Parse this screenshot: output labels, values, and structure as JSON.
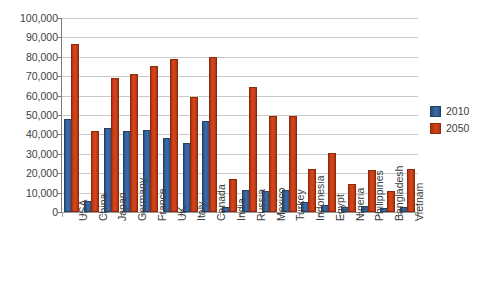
{
  "chart_data": {
    "type": "bar",
    "title": "",
    "subtitle": "",
    "xlabel": "",
    "ylabel": "",
    "ylim": [
      0,
      100000
    ],
    "ytick_step": 10000,
    "ytick_labels": [
      "100,000",
      "90,000",
      "80,000",
      "70,000",
      "60,000",
      "50,000",
      "40,000",
      "30,000",
      "20,000",
      "10,000",
      "0"
    ],
    "grid": "horizontal",
    "legend_position": "right",
    "categories": [
      "USA",
      "China",
      "Japan",
      "Germany",
      "France",
      "UK",
      "Italy",
      "Canada",
      "India",
      "Russia",
      "Mexico",
      "Turkey",
      "Indonesia",
      "Egypt",
      "Nigeria",
      "Philippines",
      "Bangladesh",
      "Vietnam"
    ],
    "series": [
      {
        "name": "2010",
        "color": "#35639f",
        "values": [
          47000,
          4500,
          42500,
          40500,
          41500,
          37000,
          34500,
          46000,
          1800,
          10500,
          10000,
          10500,
          4000,
          2500,
          1800,
          2000,
          800,
          1500
        ]
      },
      {
        "name": "2050",
        "color": "#d0421b",
        "values": [
          85500,
          40500,
          68000,
          70000,
          74000,
          78000,
          58500,
          79000,
          16000,
          63500,
          48500,
          48500,
          21000,
          29500,
          13500,
          20500,
          10000,
          21000
        ]
      }
    ]
  },
  "legend": {
    "items": [
      {
        "label": "2010",
        "color": "#35639f"
      },
      {
        "label": "2050",
        "color": "#d0421b"
      }
    ]
  }
}
